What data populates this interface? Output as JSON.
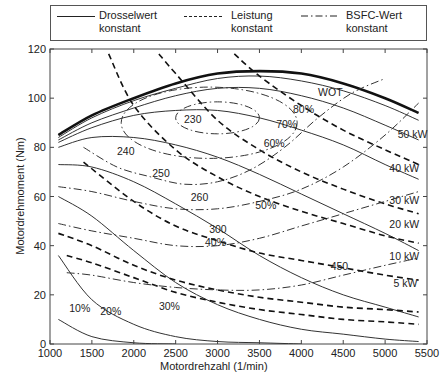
{
  "chart_data": {
    "type": "line",
    "title": "",
    "xlabel": "Motordrehzahl (1/min)",
    "ylabel": "Motordrehmoment (Nm)",
    "xlim": [
      1000,
      5500
    ],
    "ylim": [
      0,
      120
    ],
    "xticks": [
      1000,
      1500,
      2000,
      2500,
      3000,
      3500,
      4000,
      4500,
      5000,
      5500
    ],
    "yticks": [
      0,
      20,
      40,
      60,
      80,
      100,
      120
    ],
    "grid": false,
    "legend": {
      "position": "top",
      "entries": [
        {
          "label": "Drosselwert konstant",
          "style": "solid"
        },
        {
          "label": "Leistung konstant",
          "style": "dashed"
        },
        {
          "label": "BSFC-Wert konstant",
          "style": "dashdot"
        }
      ]
    },
    "series": [
      {
        "name": "WOT",
        "group": "throttle",
        "style": "solid-bold",
        "x": [
          1100,
          1500,
          2000,
          2500,
          3000,
          3500,
          4000,
          4500,
          5000,
          5400
        ],
        "y": [
          85,
          93,
          100,
          106,
          110,
          111,
          110,
          106,
          100,
          94
        ]
      },
      {
        "name": "80%",
        "group": "throttle",
        "style": "solid",
        "x": [
          1100,
          1500,
          2000,
          2500,
          3000,
          3500,
          4000,
          4500,
          5000,
          5400
        ],
        "y": [
          84,
          92,
          99,
          104,
          108,
          109,
          107,
          103,
          97,
          91
        ]
      },
      {
        "name": "70%",
        "group": "throttle",
        "style": "solid",
        "x": [
          1100,
          1500,
          2000,
          2500,
          3000,
          3500,
          4000,
          4500,
          5000,
          5400
        ],
        "y": [
          83,
          90,
          96,
          101,
          104,
          104,
          101,
          96,
          89,
          83
        ]
      },
      {
        "name": "60%",
        "group": "throttle",
        "style": "solid",
        "x": [
          1100,
          1500,
          2000,
          2500,
          3000,
          3500,
          4000,
          4500,
          5000,
          5400
        ],
        "y": [
          82,
          88,
          93,
          95,
          95,
          92,
          87,
          81,
          73,
          67
        ]
      },
      {
        "name": "50%",
        "group": "throttle",
        "style": "solid",
        "x": [
          1100,
          1500,
          2000,
          2500,
          3000,
          3500,
          4000,
          4500,
          5000,
          5400
        ],
        "y": [
          80,
          84,
          84,
          81,
          76,
          69,
          61,
          53,
          45,
          38
        ]
      },
      {
        "name": "40%",
        "group": "throttle",
        "style": "solid",
        "x": [
          1100,
          1500,
          2000,
          2500,
          3000,
          3500,
          4000,
          4500,
          5000,
          5400
        ],
        "y": [
          73,
          72,
          66,
          57,
          47,
          36,
          27,
          20,
          15,
          11
        ]
      },
      {
        "name": "30%",
        "group": "throttle",
        "style": "solid",
        "x": [
          1100,
          1500,
          2000,
          2500,
          3000,
          3500,
          4000,
          4500,
          5000,
          5400
        ],
        "y": [
          60,
          52,
          38,
          25,
          16,
          10,
          6,
          4,
          2,
          1
        ]
      },
      {
        "name": "20%",
        "group": "throttle",
        "style": "solid",
        "x": [
          1100,
          1500,
          2000,
          2500,
          3000,
          3500,
          4000
        ],
        "y": [
          36,
          18,
          8,
          3,
          1,
          0.5,
          0
        ]
      },
      {
        "name": "10%",
        "group": "throttle",
        "style": "solid",
        "x": [
          1100,
          1500,
          2000,
          2500
        ],
        "y": [
          10,
          3,
          0.5,
          0
        ]
      },
      {
        "name": "5 kW",
        "group": "power",
        "style": "dashed",
        "x": [
          1200,
          1500,
          2000,
          2500,
          3000,
          3500,
          4000,
          4500,
          5000,
          5400
        ],
        "y": [
          36,
          33,
          27,
          21,
          17,
          14,
          12,
          10,
          9,
          8
        ]
      },
      {
        "name": "10 kW",
        "group": "power",
        "style": "dashed",
        "x": [
          1100,
          1500,
          2000,
          2500,
          3000,
          3500,
          4000,
          4500,
          5000,
          5400
        ],
        "y": [
          45,
          40,
          32,
          26,
          22,
          19,
          17,
          15,
          14,
          13
        ]
      },
      {
        "name": "20 kW",
        "group": "power",
        "style": "dashed",
        "x": [
          1400,
          2000,
          2500,
          3000,
          3500,
          4000,
          4500,
          5000,
          5400
        ],
        "y": [
          74,
          58,
          48,
          42,
          37,
          34,
          31,
          28,
          26
        ]
      },
      {
        "name": "30 kW",
        "group": "power",
        "style": "dashed",
        "x": [
          1700,
          2000,
          2500,
          3000,
          3500,
          4000,
          4500,
          5000,
          5400
        ],
        "y": [
          118,
          97,
          79,
          68,
          60,
          54,
          49,
          44,
          41
        ]
      },
      {
        "name": "40 kW",
        "group": "power",
        "style": "dashed",
        "x": [
          2300,
          2500,
          3000,
          3500,
          4000,
          4500,
          5000,
          5400
        ],
        "y": [
          118,
          110,
          91,
          79,
          70,
          63,
          57,
          53
        ]
      },
      {
        "name": "50 kW",
        "group": "power",
        "style": "dashed",
        "x": [
          3200,
          3500,
          4000,
          4500,
          5000,
          5400
        ],
        "y": [
          118,
          109,
          97,
          87,
          79,
          73
        ]
      },
      {
        "name": "230",
        "group": "bsfc",
        "style": "dashdot",
        "type": "closed-contour",
        "center": [
          3000,
          92
        ],
        "approx_span_rpm": [
          2500,
          3500
        ],
        "approx_span_nm": [
          86,
          99
        ]
      },
      {
        "name": "240",
        "group": "bsfc",
        "style": "dashdot",
        "type": "closed-contour",
        "center": [
          2900,
          90
        ],
        "approx_span_rpm": [
          1900,
          4000
        ],
        "approx_span_nm": [
          75,
          104
        ]
      },
      {
        "name": "250",
        "group": "bsfc",
        "style": "dashdot",
        "x": [
          1400,
          1800,
          2200,
          2600,
          3000,
          3400,
          3800,
          4200,
          4600,
          5000
        ],
        "y": [
          80,
          72,
          68,
          65,
          66,
          71,
          80,
          92,
          102,
          108
        ]
      },
      {
        "name": "260",
        "group": "bsfc",
        "style": "dashdot",
        "x": [
          1100,
          1500,
          2000,
          2500,
          3000,
          3500,
          4000,
          4500,
          5000,
          5400
        ],
        "y": [
          64,
          62,
          58,
          55,
          55,
          58,
          63,
          72,
          85,
          98
        ]
      },
      {
        "name": "300",
        "group": "bsfc",
        "style": "dashdot",
        "x": [
          1100,
          1500,
          2000,
          2500,
          3000,
          3500,
          4000,
          4500,
          5000,
          5400
        ],
        "y": [
          49,
          46,
          43,
          40,
          40,
          43,
          48,
          53,
          58,
          62
        ]
      },
      {
        "name": "450",
        "group": "bsfc",
        "style": "dashdot",
        "x": [
          1200,
          1500,
          2000,
          2500,
          3000,
          3500,
          4000,
          4500,
          5000,
          5400
        ],
        "y": [
          29,
          28,
          25,
          23,
          22,
          22,
          24,
          28,
          32,
          35
        ]
      }
    ],
    "annotations": [
      "WOT",
      "80%",
      "70%",
      "60%",
      "50%",
      "40%",
      "30%",
      "20%",
      "10%",
      "50 kW",
      "40 kW",
      "30 kW",
      "20 kW",
      "10 kW",
      "5 kW",
      "230",
      "240",
      "250",
      "260",
      "300",
      "450"
    ]
  },
  "legend": {
    "throttle": "Drosselwert\nkonstant",
    "throttle_l1": "Drosselwert",
    "throttle_l2": "konstant",
    "power_l1": "Leistung",
    "power_l2": "konstant",
    "bsfc_l1": "BSFC-Wert",
    "bsfc_l2": "konstant"
  },
  "axes": {
    "xlabel": "Motordrehzahl (1/min)",
    "ylabel": "Motordrehmoment (Nm)"
  }
}
